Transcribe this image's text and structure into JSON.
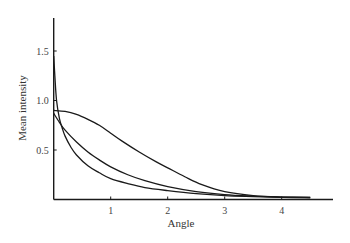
{
  "chart_data": {
    "type": "line",
    "title": "",
    "xlabel": "Angle",
    "ylabel": "Mean intensity",
    "xlim": [
      0,
      4.8
    ],
    "ylim": [
      0,
      1.8
    ],
    "grid": false,
    "legend": null,
    "x_ticks": [
      {
        "value": 1,
        "label": "1"
      },
      {
        "value": 2,
        "label": "2"
      },
      {
        "value": 3,
        "label": "3"
      },
      {
        "value": 4,
        "label": "4"
      }
    ],
    "y_ticks": [
      {
        "value": 0.5,
        "label": "0.5"
      },
      {
        "value": 1.0,
        "label": "1.0"
      },
      {
        "value": 1.5,
        "label": "1.5"
      }
    ],
    "series": [
      {
        "name": "curve-broad",
        "x": [
          0,
          0.2,
          0.4,
          0.6,
          0.8,
          1.0,
          1.2,
          1.5,
          1.8,
          2.0,
          2.3,
          2.6,
          3.0,
          3.5,
          4.0,
          4.5
        ],
        "values": [
          0.9,
          0.89,
          0.86,
          0.81,
          0.75,
          0.67,
          0.59,
          0.48,
          0.38,
          0.32,
          0.23,
          0.15,
          0.08,
          0.04,
          0.025,
          0.02
        ]
      },
      {
        "name": "curve-medium",
        "x": [
          0,
          0.1,
          0.2,
          0.4,
          0.6,
          0.8,
          1.0,
          1.3,
          1.6,
          2.0,
          2.5,
          3.0,
          3.5,
          4.0,
          4.5
        ],
        "values": [
          0.87,
          0.78,
          0.7,
          0.58,
          0.48,
          0.4,
          0.33,
          0.25,
          0.19,
          0.13,
          0.08,
          0.05,
          0.035,
          0.025,
          0.02
        ]
      },
      {
        "name": "curve-sharp",
        "x": [
          0,
          0.02,
          0.05,
          0.1,
          0.15,
          0.2,
          0.3,
          0.4,
          0.6,
          0.8,
          1.0,
          1.3,
          1.6,
          2.0,
          2.5,
          3.0,
          3.5,
          4.0,
          4.5
        ],
        "values": [
          1.45,
          1.25,
          1.0,
          0.82,
          0.72,
          0.64,
          0.53,
          0.45,
          0.34,
          0.27,
          0.21,
          0.16,
          0.12,
          0.09,
          0.06,
          0.04,
          0.03,
          0.022,
          0.018
        ]
      }
    ],
    "style": {
      "line_color": "#1a1a1a",
      "axis_color": "#1a1a1a",
      "background": "#ffffff"
    }
  }
}
